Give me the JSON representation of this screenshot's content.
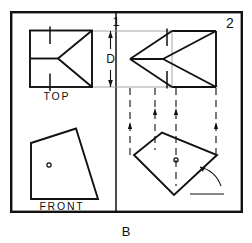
{
  "figure": {
    "plate_label": "B",
    "panel_left_label": "1",
    "panel_right_label": "2",
    "dimension_label": "D",
    "view_labels": {
      "top": "TOP",
      "front": "FRONT"
    },
    "colors": {
      "ink": "#111111",
      "paper": "#ffffff",
      "thin_line": "#8a8a8a",
      "construction_line": "#7a7a7a"
    },
    "border": {
      "x": 10,
      "y": 11,
      "width": 233,
      "height": 202,
      "stroke_width": 2.4
    },
    "divider": {
      "x": 116,
      "y_top": 11,
      "y_bottom": 213,
      "stroke_width": 1.6
    },
    "geometry": {
      "top_view_left": {
        "name": "top-view-original",
        "rect": {
          "x": 30,
          "y": 30,
          "width": 62,
          "height": 56
        },
        "apex": {
          "x": 58,
          "y": 58
        },
        "spine_start": {
          "x": 30,
          "y": 58
        },
        "tick_top": {
          "x": 50,
          "y1": 27,
          "y2": 44
        },
        "tick_bottom": {
          "x": 50,
          "y1": 73,
          "y2": 90
        }
      },
      "top_view_right": {
        "name": "top-view-rotated",
        "apex": {
          "x": 130,
          "y": 59
        },
        "rect": {
          "x": 172,
          "y": 31,
          "width": 44,
          "height": 56
        },
        "upper_fold": {
          "x": 162,
          "y": 42
        },
        "lower_fold": {
          "x": 162,
          "y": 75
        },
        "tick_upper": {
          "x": 167,
          "y1": 29,
          "y2": 46
        },
        "tick_lower": {
          "x": 167,
          "y1": 60,
          "y2": 78
        }
      },
      "front_view_left": {
        "name": "front-view-original",
        "points": [
          [
            31,
            143
          ],
          [
            76,
            129
          ],
          [
            98,
            199
          ],
          [
            31,
            199
          ]
        ],
        "marker": {
          "cx": 49,
          "cy": 165,
          "r": 2.2
        }
      },
      "front_view_right": {
        "name": "front-view-rotated",
        "points": [
          [
            134,
            155
          ],
          [
            162,
            133
          ],
          [
            217,
            155
          ],
          [
            174,
            195
          ]
        ],
        "marker": {
          "cx": 176,
          "cy": 160,
          "r": 2.2
        },
        "angle_arc": {
          "cx": 193,
          "cy": 194,
          "r": 28,
          "start_deg": 0,
          "end_deg": 58
        },
        "angle_base": {
          "x1": 193,
          "y1": 194,
          "x2": 223,
          "y2": 194
        }
      },
      "dimension_D": {
        "x": 111,
        "y_top": 31,
        "y_bottom": 87,
        "ext_top_y": 31,
        "ext_bottom_y": 87,
        "tick_mark": {
          "x": 116,
          "y1": 16,
          "y2": 27
        }
      },
      "projection_lines": [
        {
          "x": 130,
          "y_top": 90,
          "y_bottom": 156,
          "arrow_y": 124
        },
        {
          "x": 155,
          "y_top": 90,
          "y_bottom": 150,
          "arrow_y": 110
        },
        {
          "x": 176,
          "y_top": 90,
          "y_bottom": 185,
          "arrow_y": 110
        },
        {
          "x": 216,
          "y_top": 90,
          "y_bottom": 158,
          "arrow_y": 124
        }
      ],
      "reference_lines": [
        {
          "x1": 92,
          "y1": 31,
          "x2": 200,
          "y2": 31
        },
        {
          "x1": 92,
          "y1": 87,
          "x2": 216,
          "y2": 87
        }
      ]
    }
  }
}
